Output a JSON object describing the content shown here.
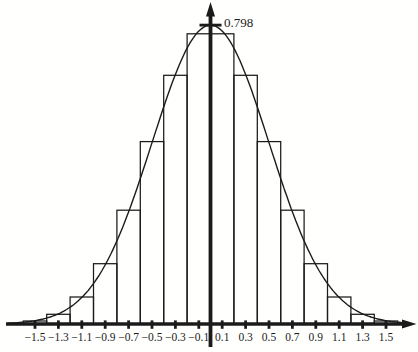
{
  "figure": {
    "background": "#ffffff",
    "ink_color": "#1b1b1b"
  },
  "chart_data": {
    "type": "bar",
    "subtype": "histogram-with-normal-curve-overlay",
    "title": "",
    "xlabel": "",
    "ylabel": "",
    "grid": false,
    "legend": null,
    "bar_width": 0.2,
    "bar_centers": [
      -1.5,
      -1.3,
      -1.1,
      -0.9,
      -0.7,
      -0.5,
      -0.3,
      -0.1,
      0.1,
      0.3,
      0.5,
      0.7,
      0.9,
      1.1,
      1.3,
      1.5
    ],
    "categories": [
      "−1.5",
      "−1.3",
      "−1.1",
      "−0.9",
      "−0.7",
      "−0.5",
      "−0.3",
      "−0.1",
      "0.1",
      "0.3",
      "0.5",
      "0.7",
      "0.9",
      "1.1",
      "1.3",
      "1.5"
    ],
    "values": [
      0.008,
      0.026,
      0.072,
      0.161,
      0.304,
      0.487,
      0.664,
      0.775,
      0.775,
      0.664,
      0.487,
      0.304,
      0.161,
      0.072,
      0.026,
      0.008
    ],
    "x_tick_values": [
      -1.5,
      -1.3,
      -1.1,
      -0.9,
      -0.7,
      -0.5,
      -0.3,
      -0.1,
      0.1,
      0.3,
      0.5,
      0.7,
      0.9,
      1.1,
      1.3,
      1.5
    ],
    "x_tick_labels": [
      "−1.5",
      "−1.3",
      "−1.1",
      "−0.9",
      "−0.7",
      "−0.5",
      "−0.3",
      "−0.1",
      "0.1",
      "0.3",
      "0.5",
      "0.7",
      "0.9",
      "1.1",
      "1.3",
      "1.5"
    ],
    "xlim": [
      -1.78,
      1.78
    ],
    "ylim": [
      0,
      0.87
    ],
    "curve": {
      "type": "normal_pdf",
      "mean": 0,
      "sigma": 0.5,
      "peak_value": 0.798,
      "peak_label": "0.798",
      "x_start": -1.73,
      "x_end": 1.64
    },
    "y_axis_marks": [
      {
        "value": 0.798,
        "label": "0.798"
      }
    ]
  }
}
